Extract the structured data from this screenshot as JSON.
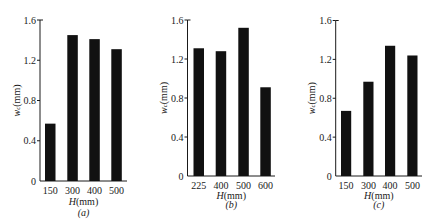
{
  "figure": {
    "panels": [
      "(a)",
      "(b)",
      "(c)"
    ]
  },
  "chart_data": [
    {
      "type": "bar",
      "title": "(a)",
      "categories": [
        "150",
        "300",
        "400",
        "500"
      ],
      "values": [
        0.57,
        1.45,
        1.41,
        1.31
      ],
      "xlabel": {
        "var": "H",
        "unit": "(mm)"
      },
      "ylabel": {
        "var": "w",
        "sub": "c",
        "unit": "(mm)"
      },
      "ylim": [
        0,
        1.6
      ],
      "yticks": [
        "0",
        "0.4",
        "0.8",
        "1.2",
        "1.6"
      ],
      "subcaption": "(a)",
      "bar_color": "#111111",
      "grid": false,
      "legend": null
    },
    {
      "type": "bar",
      "title": "(b)",
      "categories": [
        "225",
        "400",
        "500",
        "600"
      ],
      "values": [
        1.31,
        1.28,
        1.52,
        0.91
      ],
      "xlabel": {
        "var": "H",
        "unit": "(mm)"
      },
      "ylabel": {
        "var": "w",
        "sub": "c",
        "unit": "(mm)"
      },
      "ylim": [
        0,
        1.6
      ],
      "yticks": [
        "0",
        "0.4",
        "0.8",
        "1.2",
        "1.6"
      ],
      "subcaption": "(b)",
      "bar_color": "#111111",
      "grid": false,
      "legend": null
    },
    {
      "type": "bar",
      "title": "(c)",
      "categories": [
        "150",
        "300",
        "400",
        "500"
      ],
      "values": [
        0.67,
        0.97,
        1.34,
        1.24
      ],
      "xlabel": {
        "var": "H",
        "unit": "(mm)"
      },
      "ylabel": {
        "var": "w",
        "sub": "c",
        "unit": "(mm)"
      },
      "ylim": [
        0,
        1.6
      ],
      "yticks": [
        "0",
        "0.4",
        "0.8",
        "1.2",
        "1.6"
      ],
      "subcaption": "(c)",
      "bar_color": "#111111",
      "grid": false,
      "legend": null
    }
  ]
}
